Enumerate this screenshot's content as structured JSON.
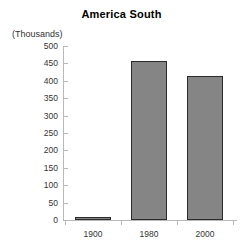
{
  "chart_data": {
    "type": "bar",
    "title": "America South",
    "subtitle": "",
    "units_caption": "(Thousands)",
    "xlabel": "",
    "ylabel": "",
    "categories": [
      "1900",
      "1980",
      "2000"
    ],
    "values": [
      8,
      458,
      415
    ],
    "series": [
      {
        "name": "America South",
        "values": [
          8,
          458,
          415
        ]
      }
    ],
    "ylim": [
      0,
      500
    ],
    "y_ticks": [
      0,
      50,
      100,
      150,
      200,
      250,
      300,
      350,
      400,
      450,
      500
    ],
    "y_tick_labels": [
      "0",
      "50",
      "100",
      "150",
      "200",
      "250",
      "300",
      "350",
      "400",
      "450",
      "500"
    ],
    "grid": false,
    "legend": false,
    "legend_position": "none",
    "bar_fill_color": "#858585",
    "bar_border_color": "#2b2b2b",
    "axis_color": "#b9b9b9",
    "text_color": "#333333",
    "title_color": "#000000",
    "background_color": "#ffffff"
  }
}
